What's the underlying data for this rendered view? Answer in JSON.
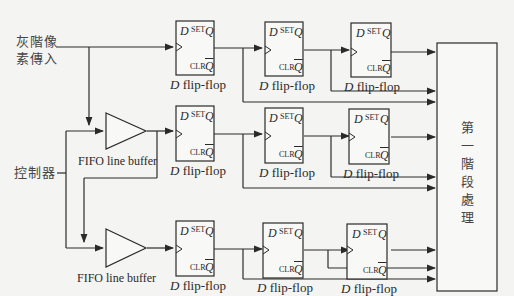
{
  "inputs": {
    "gray_pixel_line1": "灰階像",
    "gray_pixel_line2": "素傳入",
    "controller": "控制器"
  },
  "fifo": [
    {
      "label": "FIFO line buffer"
    },
    {
      "label": "FIFO line buffer"
    }
  ],
  "flipflop": {
    "d": "D",
    "set": "SET",
    "q": "Q",
    "clr": "CLR",
    "qbar": "Q",
    "name_italic": "D",
    "name_rest": " flip-flop"
  },
  "stage1": {
    "chars": [
      "第",
      "一",
      "階",
      "段",
      "處",
      "理"
    ]
  }
}
